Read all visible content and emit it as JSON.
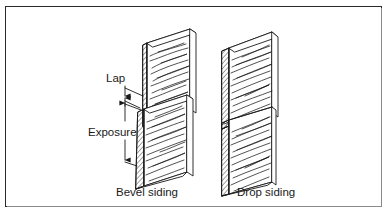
{
  "figure": {
    "type": "technical-line-illustration",
    "background_color": "#ffffff",
    "line_color": "#1a1a1a",
    "frame_color": "#2a2a2a",
    "frame": {
      "present": true,
      "style": "thin rectangular border"
    }
  },
  "labels": {
    "lap": "Lap",
    "exposure": "Exposure"
  },
  "captions": {
    "left": "Bevel siding",
    "right": "Drop siding"
  },
  "dimensions": [
    {
      "name": "lap",
      "label": "Lap",
      "arrow_style": "double-ended vertical",
      "description": "Vertical overlap distance between upper and lower bevel boards"
    },
    {
      "name": "exposure",
      "label": "Exposure",
      "arrow_style": "double-ended vertical",
      "description": "Vertical exposed face height of the lower bevel board"
    }
  ],
  "objects": [
    {
      "name": "bevel-siding-upper-board",
      "group": "bevel siding",
      "position": "upper",
      "hatched_end_grain": true
    },
    {
      "name": "bevel-siding-lower-board",
      "group": "bevel siding",
      "position": "lower",
      "hatched_end_grain": true
    },
    {
      "name": "drop-siding-upper-board",
      "group": "drop siding",
      "position": "upper",
      "hatched_end_grain": true
    },
    {
      "name": "drop-siding-lower-board",
      "group": "drop siding",
      "position": "lower",
      "hatched_end_grain": true
    }
  ]
}
